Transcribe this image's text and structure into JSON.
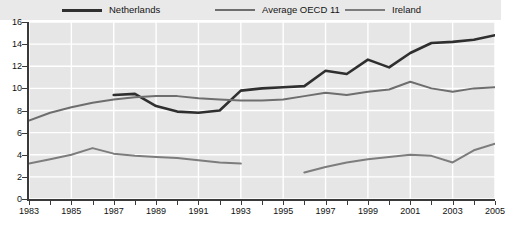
{
  "legend": {
    "items": [
      {
        "label": "Netherlands",
        "color": "#2f2f2f",
        "key": "netherlands"
      },
      {
        "label": "Average OECD 11",
        "color": "#6e6e6e",
        "key": "oecd"
      },
      {
        "label": "Ireland",
        "color": "#7d7d7d",
        "key": "ireland"
      }
    ]
  },
  "axes": {
    "y_ticks": [
      "0",
      "2",
      "4",
      "6",
      "8",
      "10",
      "12",
      "14",
      "16"
    ],
    "x_ticks": [
      "1983",
      "1985",
      "1987",
      "1989",
      "1991",
      "1993",
      "1995",
      "1997",
      "1999",
      "2001",
      "2003",
      "2005"
    ]
  },
  "chart_data": {
    "type": "line",
    "title": "",
    "xlabel": "",
    "ylabel": "",
    "xlim": [
      1983,
      2005
    ],
    "ylim": [
      0,
      16
    ],
    "y_tick_step": 2,
    "x_tick_step": 1,
    "x_label_step": 2,
    "grid": true,
    "legend_position": "top",
    "x": [
      1983,
      1984,
      1985,
      1986,
      1987,
      1988,
      1989,
      1990,
      1991,
      1992,
      1993,
      1994,
      1995,
      1996,
      1997,
      1998,
      1999,
      2000,
      2001,
      2002,
      2003,
      2004,
      2005
    ],
    "series": [
      {
        "name": "Netherlands",
        "color": "#2f2f2f",
        "width": 2.6,
        "values": [
          null,
          null,
          null,
          null,
          9.4,
          9.5,
          8.4,
          7.9,
          7.8,
          8.0,
          9.8,
          10.0,
          10.1,
          10.2,
          11.6,
          11.3,
          12.6,
          11.9,
          13.2,
          14.1,
          14.2,
          14.4,
          14.8
        ]
      },
      {
        "name": "Average OECD 11",
        "color": "#6e6e6e",
        "width": 2.0,
        "values": [
          7.1,
          7.8,
          8.3,
          8.7,
          9.0,
          9.2,
          9.3,
          9.3,
          9.1,
          9.0,
          8.9,
          8.9,
          9.0,
          9.3,
          9.6,
          9.4,
          9.7,
          9.9,
          10.6,
          10.0,
          9.7,
          10.0,
          10.1
        ]
      },
      {
        "name": "Ireland",
        "color": "#7d7d7d",
        "width": 2.0,
        "values": [
          3.2,
          3.6,
          4.0,
          4.6,
          4.1,
          3.9,
          3.8,
          3.7,
          3.5,
          3.3,
          3.2,
          null,
          null,
          2.4,
          2.9,
          3.3,
          3.6,
          3.8,
          4.0,
          3.9,
          3.3,
          4.4,
          5.0
        ]
      }
    ]
  }
}
